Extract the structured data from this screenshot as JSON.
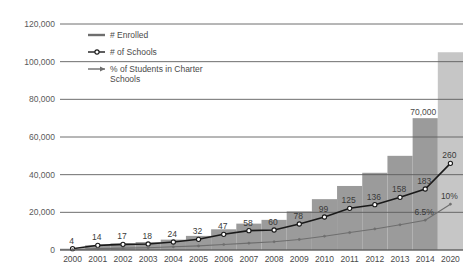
{
  "chart_data": {
    "type": "bar",
    "title": "",
    "xlabel": "",
    "ylabel": "",
    "ylim": [
      0,
      120000
    ],
    "grid": true,
    "legend_position": "top-left",
    "categories": [
      "2000",
      "2001",
      "2002",
      "2003",
      "2004",
      "2005",
      "2006",
      "2007",
      "2008",
      "2009",
      "2010",
      "2011",
      "2012",
      "2013",
      "2014",
      "2020"
    ],
    "ytick_labels": [
      "120,000",
      "100,000",
      "80,000",
      "60,000",
      "40,000",
      "20,000",
      "0"
    ],
    "ytick_values": [
      120000,
      100000,
      80000,
      60000,
      40000,
      20000,
      0
    ],
    "series": [
      {
        "name": "# Enrolled",
        "type": "bar",
        "color": "#9b9b9b",
        "projected_color": "#c6c6c6",
        "values": [
          700,
          2500,
          3500,
          4200,
          5500,
          7500,
          11000,
          14000,
          16000,
          20500,
          27000,
          34000,
          41000,
          50000,
          70000,
          105000
        ],
        "labels": [
          "",
          "",
          "",
          "",
          "",
          "",
          "",
          "",
          "",
          "",
          "",
          "",
          "",
          "",
          "70,000",
          ""
        ],
        "projected_index": 15
      },
      {
        "name": "# of Schools",
        "type": "line",
        "color": "#1a1a1a",
        "marker": "open-circle",
        "values": [
          4,
          14,
          17,
          18,
          24,
          32,
          47,
          58,
          60,
          78,
          99,
          125,
          136,
          158,
          183,
          260
        ],
        "labels": [
          "4",
          "14",
          "17",
          "18",
          "24",
          "32",
          "47",
          "58",
          "60",
          "78",
          "99",
          "125",
          "136",
          "158",
          "183",
          "260"
        ]
      },
      {
        "name": "% of Students in Charter Schools",
        "type": "line",
        "color": "#6e6e6e",
        "marker": "small-dot",
        "values": [
          0.1,
          0.3,
          0.4,
          0.5,
          0.7,
          0.9,
          1.2,
          1.5,
          1.8,
          2.3,
          3.0,
          3.8,
          4.6,
          5.5,
          6.5,
          10.0
        ],
        "labels": [
          "",
          "",
          "",
          "",
          "",
          "",
          "",
          "",
          "",
          "",
          "",
          "",
          "",
          "",
          "6.5%",
          "10%"
        ]
      }
    ]
  },
  "legend": {
    "items": [
      {
        "label": "# Enrolled",
        "marker": "solid-line",
        "color": "#6e6e6e"
      },
      {
        "label": "# of Schools",
        "marker": "line-with-open-circle",
        "color": "#1a1a1a"
      },
      {
        "label": "% of Students in Charter",
        "label_line2": "Schools",
        "marker": "line-with-arrow",
        "color": "#6e6e6e"
      }
    ]
  }
}
